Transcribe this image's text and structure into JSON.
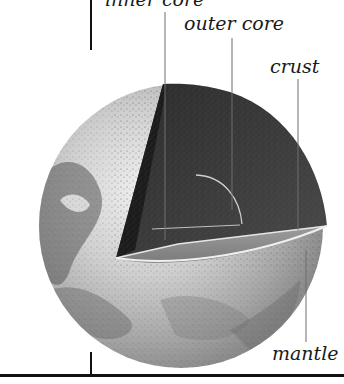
{
  "diagram": {
    "labels": {
      "inner_core": "inner core",
      "outer_core": "outer core",
      "crust": "crust",
      "mantle": "mantle"
    },
    "colors": {
      "background": "#ffffff",
      "sphere_light": "#d8d8d8",
      "sphere_mid": "#9a9a9a",
      "cutaway_dark": "#3a3a3a",
      "cutaway_floor": "#8c8c8c",
      "rule": "#111111",
      "leader": "#6e6e6e"
    }
  }
}
